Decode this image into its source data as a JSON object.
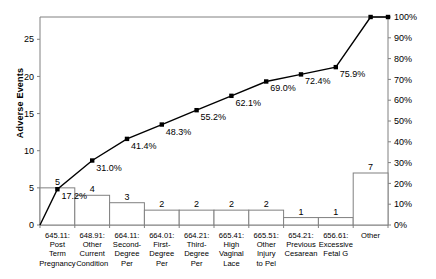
{
  "chart_data": {
    "type": "bar",
    "title": "",
    "subtitle": "",
    "xlabel": "",
    "ylabel": "Adverse Events",
    "y2label": "",
    "ylim": [
      0,
      28
    ],
    "y2lim": [
      0,
      100
    ],
    "yticks": [
      "0",
      "5",
      "10",
      "15",
      "20",
      "25"
    ],
    "ytick_values": [
      0,
      5,
      10,
      15,
      20,
      25
    ],
    "y2ticks": [
      "0%",
      "10%",
      "20%",
      "30%",
      "40%",
      "50%",
      "60%",
      "70%",
      "80%",
      "90%",
      "100%"
    ],
    "y2tick_values": [
      0,
      10,
      20,
      30,
      40,
      50,
      60,
      70,
      80,
      90,
      100
    ],
    "grid": false,
    "legend": "none",
    "total": 29,
    "categories": [
      "645.11: Post Term Pregnancy",
      "648.91: Other Current Condition",
      "664.11: Second-Degree Per",
      "664.01: First-Degree Per",
      "664.21: Third-Degree Per",
      "665.41: High Vaginal Lace",
      "665.51: Other Injury to Pel",
      "654.21: Previous Cesarean",
      "656.61: Excessive Fetal G",
      "Other"
    ],
    "category_lines": [
      [
        "645.11:",
        "Post",
        "Term",
        "Pregnancy"
      ],
      [
        "648.91:",
        "Other",
        "Current",
        "Condition"
      ],
      [
        "664.11:",
        "Second-",
        "Degree",
        "Per"
      ],
      [
        "664.01:",
        "First-",
        "Degree",
        "Per"
      ],
      [
        "664.21:",
        "Third-",
        "Degree",
        "Per"
      ],
      [
        "665.41:",
        "High",
        "Vaginal",
        "Lace"
      ],
      [
        "665.51:",
        "Other",
        "Injury",
        "to Pel"
      ],
      [
        "654.21:",
        "Previous",
        "Cesarean"
      ],
      [
        "656.61:",
        "Excessive",
        "Fetal G"
      ],
      [
        "Other"
      ]
    ],
    "values": [
      5,
      4,
      3,
      2,
      2,
      2,
      2,
      1,
      1,
      7
    ],
    "value_labels": [
      "5",
      "4",
      "3",
      "2",
      "2",
      "2",
      "2",
      "1",
      "1",
      "7"
    ],
    "cumulative_percent": [
      17.2,
      31.0,
      41.4,
      48.3,
      55.2,
      62.1,
      69.0,
      72.4,
      75.9,
      100.0
    ],
    "cumulative_labels": [
      "17.2%",
      "31.0%",
      "41.4%",
      "48.3%",
      "55.2%",
      "62.1%",
      "69.0%",
      "72.4%",
      "75.9%",
      "100%"
    ],
    "cumulative_visible_labels": [
      "17.2%",
      "31.0%",
      "41.4%",
      "48.3%",
      "55.2%",
      "62.1%",
      "69.0%",
      "72.4%",
      "75.9%"
    ],
    "series": [
      {
        "name": "Adverse Events",
        "type": "bar",
        "values": [
          5,
          4,
          3,
          2,
          2,
          2,
          2,
          1,
          1,
          7
        ]
      },
      {
        "name": "Cumulative %",
        "type": "line",
        "values": [
          17.2,
          31.0,
          41.4,
          48.3,
          55.2,
          62.1,
          69.0,
          72.4,
          75.9,
          100.0
        ]
      }
    ],
    "colors": {
      "bar_fill": "#ffffff",
      "bar_stroke": "#808080",
      "line": "#000000",
      "marker": "#000000",
      "axis": "#808080",
      "text": "#000000"
    }
  }
}
